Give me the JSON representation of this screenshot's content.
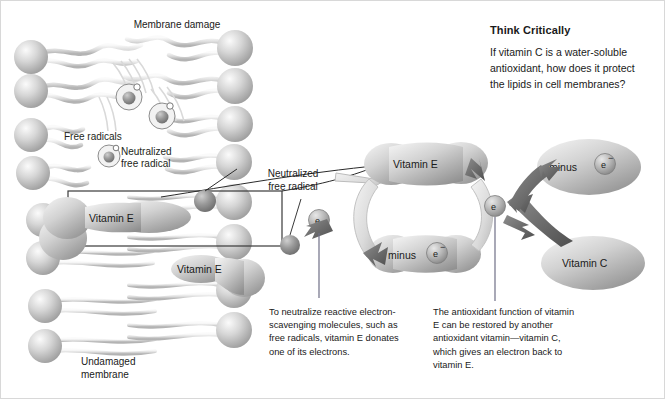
{
  "figure": {
    "title_visible": false,
    "background": "#ffffff",
    "border_color": "#d8d8d8"
  },
  "palette": {
    "head_light": "#f0f0f0",
    "head_mid": "#c9c9c9",
    "head_dark": "#9a9a9a",
    "arrow_light": "#e3e3e3",
    "arrow_dark": "#6e6e6e",
    "radical_fill": "#8c8c8c",
    "text": "#1a1a1a",
    "outline": "#555555"
  },
  "membrane": {
    "labels": {
      "damage": "Membrane\ndamage",
      "free_radicals": "Free radicals",
      "neutralized_free_radical": "Neutralized\nfree radical",
      "undamaged": "Undamaged\nmembrane",
      "vitamin_e_box": "Vitamin  E",
      "vitamin_e_lower": "Vitamin  E"
    },
    "rows_top_damaged": 4,
    "rows_bottom_intact": 6,
    "callout_box": true
  },
  "center": {
    "neutralized_free_radical_label": "Neutralized\nfree\nradical",
    "electron_label": "e"
  },
  "cycle": {
    "vitamin_e_label": "Vitamin E",
    "vitamin_e_minus_label": "minus",
    "electron_superscript": "e",
    "minus_sign": "−"
  },
  "vitaminc": {
    "minus_label": "minus",
    "electron_superscript": "e",
    "vitamin_c_label": "Vitamin C"
  },
  "captions": {
    "left": "To neutralize reactive\nelectron-scavenging\nmolecules, such as free\nradicals, vitamin E donates\none of its electrons.",
    "right": "The antioxidant function\nof vitamin E can be restored\nby another antioxidant\nvitamin—vitamin C, which\ngives an electron back to\nvitamin E."
  },
  "think_critically": {
    "heading": "Think Critically",
    "body": "If vitamin C is a water-soluble\nantioxidant, how does it protect\nthe lipids in cell membranes?"
  }
}
